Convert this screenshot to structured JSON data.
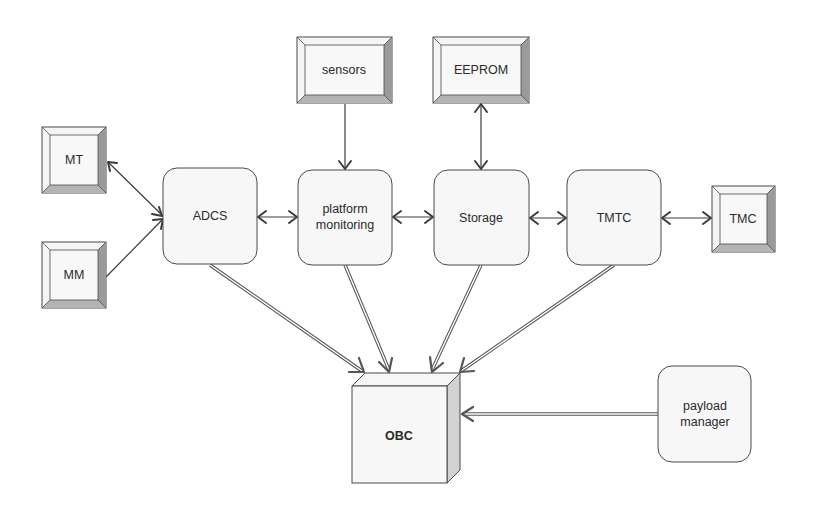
{
  "diagram": {
    "type": "block-diagram",
    "nodes": {
      "mt": {
        "label": "MT",
        "shape": "bevel"
      },
      "mm": {
        "label": "MM",
        "shape": "bevel"
      },
      "sensors": {
        "label": "sensors",
        "shape": "bevel"
      },
      "eeprom": {
        "label": "EEPROM",
        "shape": "bevel"
      },
      "tmc": {
        "label": "TMC",
        "shape": "bevel"
      },
      "adcs": {
        "label": "ADCS",
        "shape": "rounded"
      },
      "platform_monitoring": {
        "label_line1": "platform",
        "label_line2": "monitoring",
        "shape": "rounded"
      },
      "storage": {
        "label": "Storage",
        "shape": "rounded"
      },
      "tmtc": {
        "label": "TMTC",
        "shape": "rounded"
      },
      "payload_manager": {
        "label_line1": "payload",
        "label_line2": "manager",
        "shape": "rounded"
      },
      "obc": {
        "label": "OBC",
        "shape": "cube"
      }
    },
    "edges": [
      {
        "from": "ADCS",
        "to": "MT",
        "direction": "bidirectional"
      },
      {
        "from": "MM",
        "to": "ADCS",
        "direction": "forward"
      },
      {
        "from": "ADCS",
        "to": "platform monitoring",
        "direction": "bidirectional"
      },
      {
        "from": "sensors",
        "to": "platform monitoring",
        "direction": "forward"
      },
      {
        "from": "platform monitoring",
        "to": "Storage",
        "direction": "bidirectional"
      },
      {
        "from": "EEPROM",
        "to": "Storage",
        "direction": "bidirectional"
      },
      {
        "from": "Storage",
        "to": "TMTC",
        "direction": "bidirectional"
      },
      {
        "from": "TMTC",
        "to": "TMC",
        "direction": "bidirectional"
      },
      {
        "from": "ADCS",
        "to": "OBC",
        "direction": "forward",
        "style": "double"
      },
      {
        "from": "platform monitoring",
        "to": "OBC",
        "direction": "forward",
        "style": "double"
      },
      {
        "from": "Storage",
        "to": "OBC",
        "direction": "forward",
        "style": "double"
      },
      {
        "from": "TMTC",
        "to": "OBC",
        "direction": "forward",
        "style": "double"
      },
      {
        "from": "payload manager",
        "to": "OBC",
        "direction": "forward",
        "style": "double"
      }
    ]
  }
}
